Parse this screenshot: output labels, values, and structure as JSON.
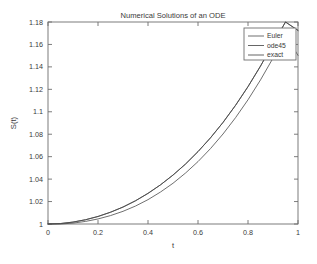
{
  "figure": {
    "title": "Numerical Solutions of an ODE",
    "background_color": "#ffffff",
    "axis_color": "#6e6e6e",
    "text_color": "#3a3a3a"
  },
  "chart_data": {
    "type": "line",
    "title": "Numerical Solutions of an ODE",
    "xlabel": "t",
    "ylabel": "S(t)",
    "xlim": [
      0,
      1
    ],
    "ylim": [
      1,
      1.18
    ],
    "grid": false,
    "legend_position": "upper right",
    "xticks": [
      0,
      0.2,
      0.4,
      0.6,
      0.8,
      1
    ],
    "xticklabels": [
      "0",
      "0.2",
      "0.4",
      "0.6",
      "0.8",
      "1"
    ],
    "yticks": [
      1,
      1.02,
      1.04,
      1.06,
      1.08,
      1.1,
      1.12,
      1.14,
      1.16,
      1.18
    ],
    "yticklabels": [
      "1",
      "1.02",
      "1.04",
      "1.06",
      "1.08",
      "1.1",
      "1.12",
      "1.14",
      "1.16",
      "1.18"
    ],
    "x": [
      0,
      0.05,
      0.1,
      0.15,
      0.2,
      0.25,
      0.3,
      0.35,
      0.4,
      0.45,
      0.5,
      0.55,
      0.6,
      0.65,
      0.7,
      0.75,
      0.8,
      0.85,
      0.9,
      0.95,
      1
    ],
    "series": [
      {
        "name": "Euler",
        "color": "#555555",
        "values": [
          1.0,
          1.0,
          1.0008,
          1.0023,
          1.0045,
          1.0075,
          1.0113,
          1.016,
          1.0217,
          1.0285,
          1.0363,
          1.0454,
          1.0556,
          1.0672,
          1.0802,
          1.0947,
          1.1107,
          1.1284,
          1.1478,
          1.169,
          1.1502
        ]
      },
      {
        "name": "ode45",
        "color": "#4a4a4a",
        "values": [
          1.0,
          1.0004,
          1.0017,
          1.0038,
          1.0067,
          1.0105,
          1.0151,
          1.0207,
          1.0273,
          1.0349,
          1.0436,
          1.0534,
          1.0645,
          1.0768,
          1.0905,
          1.1057,
          1.1224,
          1.1407,
          1.1607,
          1.1825,
          1.1725
        ]
      },
      {
        "name": "exact",
        "color": "#4a4a4a",
        "values": [
          1.0,
          1.0004,
          1.0017,
          1.0038,
          1.0067,
          1.0105,
          1.0151,
          1.0207,
          1.0273,
          1.0349,
          1.0436,
          1.0534,
          1.0645,
          1.0768,
          1.0905,
          1.1057,
          1.1224,
          1.1407,
          1.1607,
          1.1825,
          1.1725
        ]
      }
    ],
    "legend_entries": [
      "Euler",
      "ode45",
      "exact"
    ]
  }
}
